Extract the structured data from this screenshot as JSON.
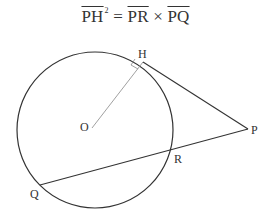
{
  "formula": {
    "lhs": "PH",
    "exponent": "2",
    "equals": "=",
    "term1": "PR",
    "times": "×",
    "term2": "PQ"
  },
  "diagram": {
    "labels": {
      "H": "H",
      "O": "O",
      "P": "P",
      "R": "R",
      "Q": "Q"
    },
    "colors": {
      "line": "#333333",
      "radius": "#888888"
    }
  }
}
